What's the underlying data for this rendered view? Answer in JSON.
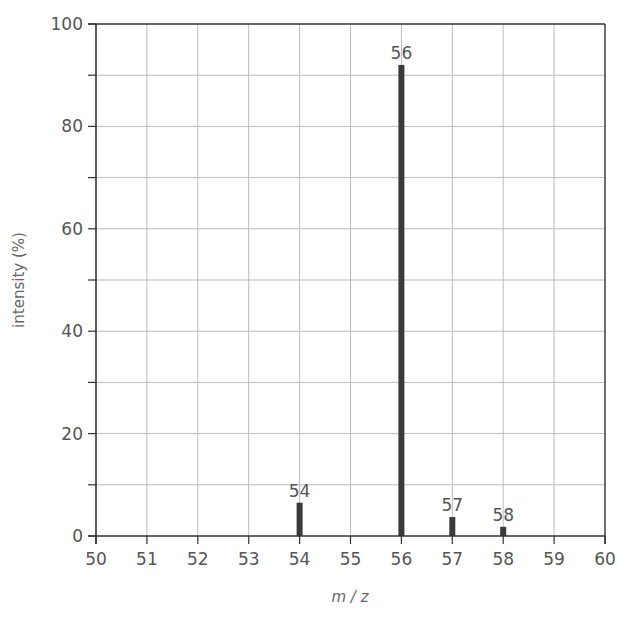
{
  "chart_data": {
    "type": "bar",
    "title": "",
    "xlabel": "m / z",
    "ylabel": "intensity (%)",
    "xlim": [
      50,
      60
    ],
    "ylim": [
      0,
      100
    ],
    "x_ticks": [
      50,
      51,
      52,
      53,
      54,
      55,
      56,
      57,
      58,
      59,
      60
    ],
    "y_ticks": [
      0,
      20,
      40,
      60,
      80,
      100
    ],
    "y_minor_ticks": [
      10,
      30,
      50,
      70,
      90
    ],
    "grid": true,
    "legend": null,
    "peaks": [
      {
        "mz": 54,
        "intensity": 6.5,
        "label": "54"
      },
      {
        "mz": 56,
        "intensity": 92,
        "label": "56"
      },
      {
        "mz": 57,
        "intensity": 3.7,
        "label": "57"
      },
      {
        "mz": 58,
        "intensity": 1.8,
        "label": "58"
      }
    ],
    "colors": {
      "bar": "#3a3a3a",
      "axis": "#333333",
      "grid": "#bbbbbb",
      "text": "#555555"
    }
  }
}
